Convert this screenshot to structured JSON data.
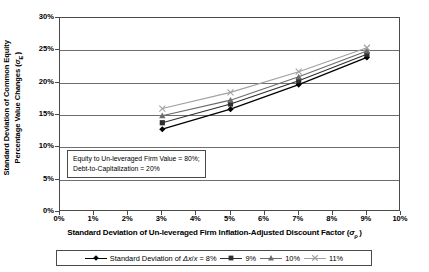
{
  "chart_data": {
    "type": "line",
    "title": "",
    "xlabel": "Standard Deviation of Un-leveraged Firm Inflation-Adjusted Discount Factor (σρ)",
    "ylabel": "Standard Deviation of Common Equity Percentage Value Changes (σE)",
    "x": [
      3,
      5,
      7,
      9
    ],
    "xlim": [
      0,
      10
    ],
    "ylim": [
      0,
      30
    ],
    "xticks": [
      "0%",
      "1%",
      "2%",
      "3%",
      "4%",
      "5%",
      "6%",
      "7%",
      "8%",
      "9%",
      "10%"
    ],
    "yticks": [
      "0%",
      "5%",
      "10%",
      "15%",
      "20%",
      "25%",
      "30%"
    ],
    "grid": "horizontal",
    "legend_position": "bottom",
    "series": [
      {
        "name": "Standard Deviation of Δx/x = 8%",
        "marker": "diamond",
        "color": "#000000",
        "values": [
          12.8,
          15.9,
          19.7,
          23.9
        ]
      },
      {
        "name": "9%",
        "marker": "square",
        "color": "#2e2e2e",
        "values": [
          13.8,
          16.7,
          20.3,
          24.4
        ]
      },
      {
        "name": "10%",
        "marker": "triangle",
        "color": "#6b6b6b",
        "values": [
          14.9,
          17.3,
          20.9,
          24.9
        ]
      },
      {
        "name": "11%",
        "marker": "x",
        "color": "#a0a0a0",
        "values": [
          16.0,
          18.5,
          21.7,
          25.4
        ]
      }
    ],
    "annotation": {
      "line1": "Equity to Un-leveraged Firm Value = 80%;",
      "line2": "Debt-to-Capitalization = 20%"
    }
  },
  "axis_titles": {
    "y_line1": "Standard Deviation of Common Equity",
    "y_line2": "Percentage Value Changes (σE)",
    "x": "Standard Deviation of Un-leveraged Firm Inflation-Adjusted Discount Factor (σρ)"
  },
  "legend": {
    "entries": [
      {
        "label": "Standard Deviation of Δx/x = 8%"
      },
      {
        "label": "9%"
      },
      {
        "label": "10%"
      },
      {
        "label": "11%"
      }
    ]
  },
  "colors": {
    "frame": "#4a4a4a",
    "grid": "#6e6e6e",
    "series_8": "#000000",
    "series_9": "#2e2e2e",
    "series_10": "#6b6b6b",
    "series_11": "#a0a0a0"
  }
}
